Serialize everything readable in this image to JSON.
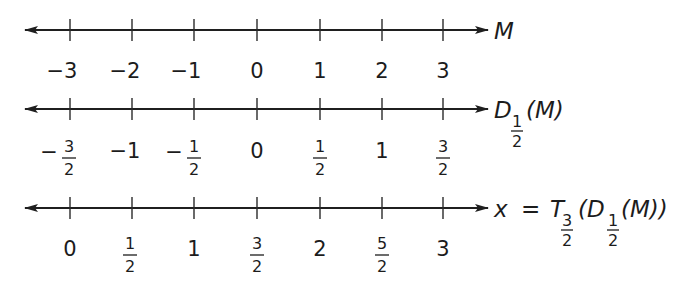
{
  "diagram": {
    "type": "number-lines",
    "lines": [
      {
        "id": "m",
        "label": {
          "var": "M"
        },
        "ticks": [
          {
            "text": "−3"
          },
          {
            "text": "−2"
          },
          {
            "text": "−1"
          },
          {
            "text": "0"
          },
          {
            "text": "1"
          },
          {
            "text": "2"
          },
          {
            "text": "3"
          }
        ]
      },
      {
        "id": "d",
        "label": {
          "fn": "D",
          "sub_num": "1",
          "sub_den": "2",
          "arg": "(M)"
        },
        "ticks": [
          {
            "sign": "−",
            "num": "3",
            "den": "2"
          },
          {
            "text": "−1"
          },
          {
            "sign": "−",
            "num": "1",
            "den": "2"
          },
          {
            "text": "0"
          },
          {
            "num": "1",
            "den": "2"
          },
          {
            "text": "1"
          },
          {
            "num": "3",
            "den": "2"
          }
        ]
      },
      {
        "id": "x",
        "label": {
          "lhs": "x",
          "eq": "=",
          "outer_fn": "T",
          "outer_sub_num": "3",
          "outer_sub_den": "2",
          "open": "(",
          "inner_fn": "D",
          "inner_sub_num": "1",
          "inner_sub_den": "2",
          "inner_arg": "(M))"
        },
        "ticks": [
          {
            "text": "0"
          },
          {
            "num": "1",
            "den": "2"
          },
          {
            "text": "1"
          },
          {
            "num": "3",
            "den": "2"
          },
          {
            "text": "2"
          },
          {
            "num": "5",
            "den": "2"
          },
          {
            "text": "3"
          }
        ]
      }
    ]
  }
}
